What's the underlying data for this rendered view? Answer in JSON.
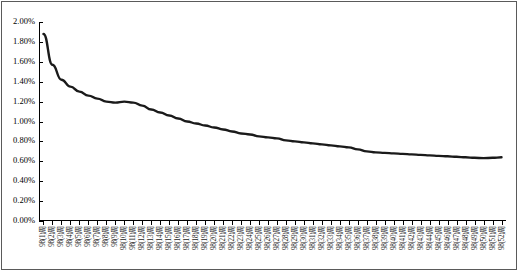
{
  "chart_data": {
    "type": "line",
    "title": "",
    "subtitle": "",
    "xlabel": "",
    "ylabel": "",
    "ylim": [
      0,
      0.02
    ],
    "ytick_labels": [
      "0.00%",
      "0.20%",
      "0.40%",
      "0.60%",
      "0.80%",
      "1.00%",
      "1.20%",
      "1.40%",
      "1.60%",
      "1.80%",
      "2.00%"
    ],
    "ytick_values": [
      0,
      0.002,
      0.004,
      0.006,
      0.008,
      0.01,
      0.012,
      0.014,
      0.016,
      0.018,
      0.02
    ],
    "grid": false,
    "legend": null,
    "line_color": "#1a1a1a",
    "line_width": 2.4,
    "categories": [
      "98(1)周",
      "98(2)周",
      "98(3)周",
      "98(4)周",
      "98(5)周",
      "98(6)周",
      "98(7)周",
      "98(8)周",
      "98(9)周",
      "98(10)周",
      "98(11)周",
      "98(12)周",
      "98(13)周",
      "98(14)周",
      "98(15)周",
      "98(16)周",
      "98(17)周",
      "98(18)周",
      "98(19)周",
      "98(20)周",
      "98(21)周",
      "98(22)周",
      "98(23)周",
      "98(24)周",
      "98(25)周",
      "98(26)周",
      "98(27)周",
      "98(28)周",
      "98(29)周",
      "98(30)周",
      "98(31)周",
      "98(32)周",
      "98(33)周",
      "98(34)周",
      "98(35)周",
      "98(36)周",
      "98(37)周",
      "98(38)周",
      "98(39)周",
      "98(40)周",
      "98(41)周",
      "98(42)周",
      "98(43)周",
      "98(44)周",
      "98(45)周",
      "98(46)周",
      "98(47)周",
      "98(48)周",
      "98(49)周",
      "98(50)周",
      "98(51)周",
      "98(52)周"
    ],
    "values": [
      1.88,
      1.57,
      1.42,
      1.35,
      1.3,
      1.26,
      1.23,
      1.2,
      1.19,
      1.2,
      1.19,
      1.16,
      1.12,
      1.09,
      1.06,
      1.03,
      1.0,
      0.98,
      0.96,
      0.94,
      0.92,
      0.9,
      0.88,
      0.87,
      0.85,
      0.84,
      0.83,
      0.81,
      0.8,
      0.79,
      0.78,
      0.77,
      0.76,
      0.75,
      0.74,
      0.72,
      0.7,
      0.69,
      0.685,
      0.68,
      0.675,
      0.67,
      0.665,
      0.66,
      0.655,
      0.65,
      0.645,
      0.64,
      0.635,
      0.632,
      0.635,
      0.64
    ],
    "value_unit": "%"
  }
}
